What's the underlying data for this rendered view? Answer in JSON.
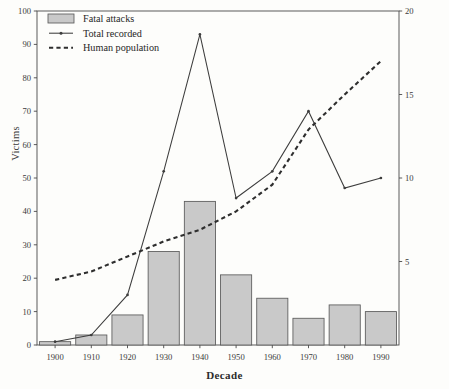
{
  "chart_data": {
    "type": "bar",
    "title": "",
    "subtitle": "",
    "xlabel": "Decade",
    "ylabel": "Victims",
    "y2label": "Population in millions",
    "categories": [
      "1900",
      "1910",
      "1920",
      "1930",
      "1940",
      "1950",
      "1960",
      "1970",
      "1980",
      "1990"
    ],
    "ylim": [
      0,
      100
    ],
    "y2lim": [
      0,
      20
    ],
    "yticks": [
      0,
      10,
      20,
      30,
      40,
      50,
      60,
      70,
      80,
      90,
      100
    ],
    "y2ticks": [
      5,
      10,
      15,
      20
    ],
    "grid": false,
    "legend_position": "top-left",
    "series": [
      {
        "name": "Fatal attacks",
        "type": "bar",
        "axis": "left",
        "color": "#c9c9c9",
        "values": [
          1,
          3,
          9,
          28,
          43,
          21,
          14,
          8,
          12,
          10
        ]
      },
      {
        "name": "Total recorded",
        "type": "line",
        "axis": "left",
        "color": "#3d3d3d",
        "values": [
          1,
          3,
          15,
          52,
          93,
          44,
          52,
          70,
          47,
          50
        ]
      },
      {
        "name": "Human population",
        "type": "line",
        "style": "dashed",
        "axis": "right",
        "color": "#2e2e2e",
        "values": [
          3.9,
          4.4,
          5.3,
          6.2,
          6.9,
          8.0,
          9.6,
          12.9,
          15.0,
          17.0
        ]
      }
    ]
  },
  "axes": {
    "left": {
      "label": "Victims",
      "ticks": [
        "0",
        "10",
        "20",
        "30",
        "40",
        "50",
        "60",
        "70",
        "80",
        "90",
        "100"
      ]
    },
    "right": {
      "label": "Population in millions",
      "ticks": [
        "5",
        "10",
        "15",
        "20"
      ]
    },
    "bottom": {
      "label": "Decade",
      "ticks": [
        "1900",
        "1910",
        "1920",
        "1930",
        "1940",
        "1950",
        "1960",
        "1970",
        "1980",
        "1990"
      ]
    }
  },
  "legend": {
    "items": [
      {
        "label": "Fatal attacks",
        "marker": "swatch"
      },
      {
        "label": "Total recorded",
        "marker": "line-with-point"
      },
      {
        "label": "Human population",
        "marker": "dashed-line"
      }
    ]
  }
}
